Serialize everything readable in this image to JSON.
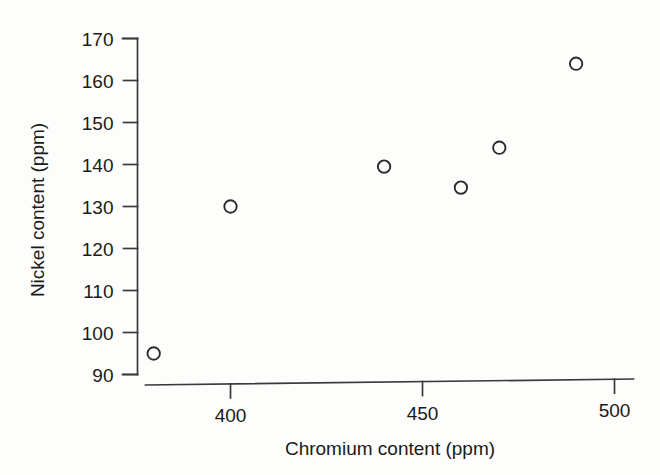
{
  "chart_data": {
    "type": "scatter",
    "title": "",
    "xlabel": "Chromium content (ppm)",
    "ylabel": "Nickel content (ppm)",
    "xlim": [
      372,
      503
    ],
    "ylim": [
      90,
      170
    ],
    "xticks": [
      400,
      450,
      500
    ],
    "xticklabels": [
      "400",
      "450",
      "500"
    ],
    "yticks": [
      90,
      100,
      110,
      120,
      130,
      140,
      150,
      160,
      170
    ],
    "yticklabels": [
      "90",
      "100",
      "110",
      "120",
      "130",
      "140",
      "150",
      "160",
      "170"
    ],
    "grid": false,
    "legend": false,
    "marker": "open-circle",
    "marker_color": "#2b2b2b",
    "series": [
      {
        "name": "samples",
        "points": [
          {
            "x": 380,
            "y": 95
          },
          {
            "x": 400,
            "y": 130
          },
          {
            "x": 440,
            "y": 139.5
          },
          {
            "x": 460,
            "y": 134.5
          },
          {
            "x": 470,
            "y": 144
          },
          {
            "x": 490,
            "y": 164
          }
        ]
      }
    ]
  },
  "axes": {
    "y_title": "Nickel content (ppm)",
    "x_title": "Chromium content (ppm)"
  },
  "colors": {
    "background": "#fdfdfc",
    "ink": "#1a1a1a",
    "axis": "#3a3a3a",
    "marker": "#2b2b2b"
  }
}
